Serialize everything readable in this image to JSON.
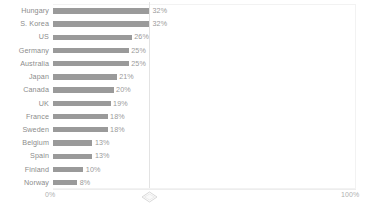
{
  "chart_data": {
    "type": "bar",
    "orientation": "horizontal",
    "title": "",
    "subtitle": "",
    "xlabel": "",
    "ylabel": "",
    "xlim": [
      0,
      100
    ],
    "grid": false,
    "legend": null,
    "axis_ticks": [
      "0%",
      "100%"
    ],
    "value_suffix": "%",
    "categories": [
      "Hungary",
      "S. Korea",
      "US",
      "Germany",
      "Australia",
      "Japan",
      "Canada",
      "UK",
      "France",
      "Sweden",
      "Belgium",
      "Spain",
      "Finland",
      "Norway"
    ],
    "values": [
      32,
      32,
      26,
      25,
      25,
      21,
      20,
      19,
      18,
      18,
      13,
      13,
      10,
      8
    ],
    "value_labels": [
      "32%",
      "32%",
      "26%",
      "25%",
      "25%",
      "21%",
      "20%",
      "19%",
      "18%",
      "18%",
      "13%",
      "13%",
      "10%",
      "8%"
    ],
    "bars": [
      {
        "category": "Hungary",
        "value": 32,
        "label": "32%"
      },
      {
        "category": "S. Korea",
        "value": 32,
        "label": "32%"
      },
      {
        "category": "US",
        "value": 26,
        "label": "26%"
      },
      {
        "category": "Germany",
        "value": 25,
        "label": "25%"
      },
      {
        "category": "Australia",
        "value": 25,
        "label": "25%"
      },
      {
        "category": "Japan",
        "value": 21,
        "label": "21%"
      },
      {
        "category": "Canada",
        "value": 20,
        "label": "20%"
      },
      {
        "category": "UK",
        "value": 19,
        "label": "19%"
      },
      {
        "category": "France",
        "value": 18,
        "label": "18%"
      },
      {
        "category": "Sweden",
        "value": 18,
        "label": "18%"
      },
      {
        "category": "Belgium",
        "value": 13,
        "label": "13%"
      },
      {
        "category": "Spain",
        "value": 13,
        "label": "13%"
      },
      {
        "category": "Finland",
        "value": 10,
        "label": "10%"
      },
      {
        "category": "Norway",
        "value": 8,
        "label": "8%"
      }
    ],
    "colors": {
      "bar": "#9a9a9a",
      "category_label": "#8c8c8c",
      "value_label": "#9a9a9a",
      "axis_label": "#b0b0b0",
      "axis_line": "#ededed",
      "divider_line": "#e3e3e3",
      "panel_border": "#f2f2f2",
      "background": "#ffffff"
    }
  },
  "axis": {
    "min_label": "0%",
    "max_label": "100%"
  },
  "slider": {
    "handle_icon": "diamond-handle-icon",
    "position_percent": 32
  }
}
